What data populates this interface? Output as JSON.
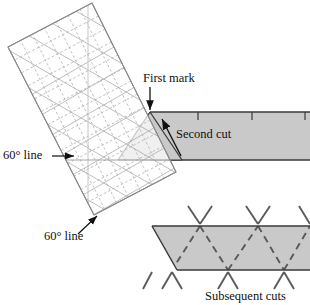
{
  "figure": {
    "background_color": "#ffffff"
  },
  "colors": {
    "fabric_fill": "#c9c9c9",
    "fabric_edge": "#3a3a3a",
    "ruler_line": "#9a9a9a",
    "ruler_grid": "#b4b4b4",
    "label_text": "#111111",
    "arrow": "#111111",
    "cut_line": "#5a5a5a"
  },
  "labels": {
    "first_mark": "First mark",
    "second_cut": "Second cut",
    "sixty_line_left": "60° line",
    "sixty_line_bottom": "60° line",
    "subsequent_cuts": "Subsequent cuts"
  },
  "annotations": [
    {
      "name": "first-mark",
      "text": "First mark",
      "x": 143,
      "y": 73,
      "pointer": "down-arrow"
    },
    {
      "name": "second-cut",
      "text": "Second cut",
      "x": 176,
      "y": 129,
      "pointer": "up-left-arrow"
    },
    {
      "name": "sixty-line-left",
      "text": "60° line",
      "x": 3,
      "y": 149,
      "pointer": "right-arrow"
    },
    {
      "name": "sixty-line-bottom",
      "text": "60° line",
      "x": 44,
      "y": 230,
      "pointer": "up-right-leader"
    },
    {
      "name": "subsequent-cuts",
      "text": "Subsequent cuts",
      "x": 205,
      "y": 290,
      "pointer": "none"
    }
  ],
  "upper_strip": {
    "name": "fabric-strip-upper",
    "top_edge_y": 112,
    "bottom_edge_y": 160,
    "left_x": 150,
    "right_x": 310,
    "tick_marks_x": [
      198,
      252,
      305
    ]
  },
  "lower_strip": {
    "name": "fabric-strip-lower",
    "top_edge_y": 226,
    "bottom_edge_y": 270,
    "top_left_x": 152,
    "bottom_left_x": 177,
    "right_x": 310,
    "zigzag_top_peaks_x": [
      200,
      258,
      310
    ],
    "zigzag_bottom_valleys_x": [
      172,
      228,
      284
    ]
  },
  "ruler": {
    "name": "quilting-ruler",
    "corners": [
      {
        "x": 92,
        "y": 3
      },
      {
        "x": 176,
        "y": 172
      },
      {
        "x": 94,
        "y": 215
      },
      {
        "x": 8,
        "y": 47
      }
    ],
    "grid_columns": 7,
    "grid_rows": 13,
    "sixty_degree_diagonals": true
  }
}
